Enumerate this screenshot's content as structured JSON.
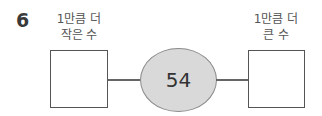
{
  "problem": {
    "number": "6",
    "center_value": "54",
    "left": {
      "label_line1": "1만큼 더",
      "label_line2": "작은 수",
      "answer": ""
    },
    "right": {
      "label_line1": "1만큼 더",
      "label_line2": "큰 수",
      "answer": ""
    },
    "colors": {
      "ellipse_fill": "#d9d9d9",
      "ellipse_border": "#8a8a8a",
      "line": "#666666",
      "box_border": "#555555"
    }
  }
}
